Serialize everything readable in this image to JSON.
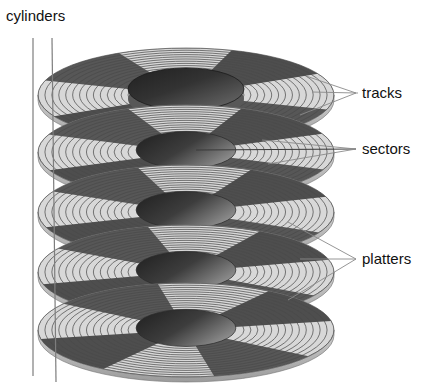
{
  "figure": {
    "background_color": "#ffffff",
    "width": 438,
    "height": 392
  },
  "labels": {
    "cylinders": "cylinders",
    "tracks": "tracks",
    "sectors": "sectors",
    "platters": "platters"
  },
  "colors": {
    "platter_light": "#d8d8d8",
    "platter_light_2": "#e2e2e2",
    "sector_dark": "#575757",
    "sector_dark_2": "#4e4e4e",
    "hub_dark": "#2b2b2b",
    "hub_light": "#6e6e6e",
    "track_stroke": "#4a4a4a",
    "leader_stroke": "#8a8a8a",
    "cylinder_stroke": "#7d7d7d",
    "text": "#111111",
    "background": "#ffffff"
  },
  "geometry": {
    "platter_count": 5,
    "platter_centers_y": [
      95,
      152,
      212,
      272,
      330
    ],
    "platter_center_x": 186,
    "platter_rx": 148,
    "platter_ry": 47,
    "hub_rx": 58,
    "hub_ry": 21,
    "track_count": 13,
    "sector_count": 8,
    "cylinder_line_x": [
      33,
      52
    ],
    "cylinder_line_top": 38,
    "cylinder_line_bottom": 382
  },
  "annotations": [
    {
      "name": "cylinders",
      "text_x": 6,
      "text_y": 17,
      "leader_count": 2
    },
    {
      "name": "tracks",
      "text_x": 362,
      "text_y": 94,
      "leader_count": 3
    },
    {
      "name": "sectors",
      "text_x": 362,
      "text_y": 150,
      "leader_count": 3
    },
    {
      "name": "platters",
      "text_x": 362,
      "text_y": 260,
      "leader_count": 3
    }
  ]
}
